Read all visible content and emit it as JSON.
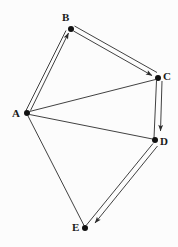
{
  "diagram": {
    "width": 178,
    "height": 247,
    "background_color": "#fcfcfc",
    "stroke_color": "#2b2b2b",
    "node_fill_color": "#111111",
    "label_color": "#1a1a1a",
    "watermark_text": "",
    "nodes": [
      {
        "id": "A",
        "label": "A",
        "x": 27,
        "y": 113,
        "label_x": 12,
        "label_y": 108,
        "r": 3.0
      },
      {
        "id": "B",
        "label": "B",
        "x": 71,
        "y": 29,
        "label_x": 62,
        "label_y": 12,
        "r": 3.0
      },
      {
        "id": "C",
        "label": "C",
        "x": 158,
        "y": 78,
        "label_x": 163,
        "label_y": 71,
        "r": 3.0
      },
      {
        "id": "D",
        "label": "D",
        "x": 155,
        "y": 140,
        "label_x": 160,
        "label_y": 136,
        "r": 3.0
      },
      {
        "id": "E",
        "label": "E",
        "x": 85,
        "y": 228,
        "label_x": 72,
        "label_y": 222,
        "r": 3.0
      }
    ],
    "edges": [
      {
        "from": "A",
        "to": "B",
        "style": "double",
        "arrow": true,
        "label": ""
      },
      {
        "from": "B",
        "to": "C",
        "style": "double",
        "arrow": true,
        "label": ""
      },
      {
        "from": "C",
        "to": "D",
        "style": "double",
        "arrow": true,
        "label": ""
      },
      {
        "from": "D",
        "to": "E",
        "style": "double",
        "arrow": true,
        "label": ""
      },
      {
        "from": "A",
        "to": "C",
        "style": "single",
        "arrow": false,
        "label": ""
      },
      {
        "from": "A",
        "to": "D",
        "style": "single",
        "arrow": false,
        "label": ""
      },
      {
        "from": "A",
        "to": "E",
        "style": "single",
        "arrow": false,
        "label": ""
      }
    ]
  }
}
